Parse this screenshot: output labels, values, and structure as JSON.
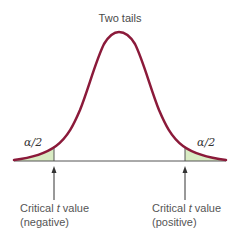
{
  "diagram": {
    "title": "Two tails",
    "tail_labels": {
      "left": "α/2",
      "right": "α/2"
    },
    "critical_labels": {
      "left": {
        "line1_prefix": "Critical ",
        "line1_var": "t",
        "line1_suffix": " value",
        "line2": "(negative)"
      },
      "right": {
        "line1_prefix": "Critical ",
        "line1_var": "t",
        "line1_suffix": " value",
        "line2": "(positive)"
      }
    },
    "colors": {
      "curve": "#8b1a3a",
      "tail_fill": "#d9ebc4",
      "baseline": "#555555",
      "arrow": "#333333"
    }
  }
}
